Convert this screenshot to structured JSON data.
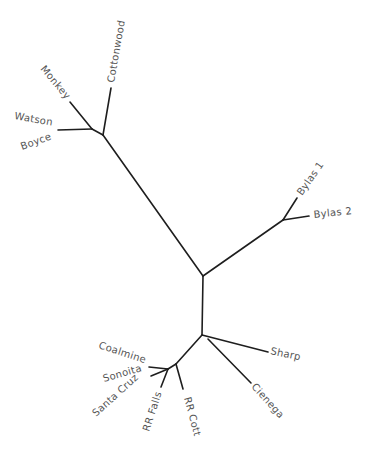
{
  "diagram": {
    "type": "unrooted-phylogenetic-tree",
    "colors": {
      "branch": "#1e1e1e",
      "label": "#555555",
      "background": "#ffffff"
    },
    "taxa": [
      {
        "id": "monkey",
        "label": "Monkey"
      },
      {
        "id": "cottonwood",
        "label": "Cottonwood"
      },
      {
        "id": "watson",
        "label": "Watson"
      },
      {
        "id": "boyce",
        "label": "Boyce"
      },
      {
        "id": "bylas1",
        "label": "Bylas 1"
      },
      {
        "id": "bylas2",
        "label": "Bylas 2"
      },
      {
        "id": "sharp",
        "label": "Sharp"
      },
      {
        "id": "cienega",
        "label": "Cienega"
      },
      {
        "id": "coalmine",
        "label": "Coalmine"
      },
      {
        "id": "sonoita",
        "label": "Sonoita"
      },
      {
        "id": "santacruz",
        "label": "Santa Cruz"
      },
      {
        "id": "rrfalls",
        "label": "RR Falls"
      },
      {
        "id": "rrcott",
        "label": "RR Cott"
      }
    ]
  }
}
